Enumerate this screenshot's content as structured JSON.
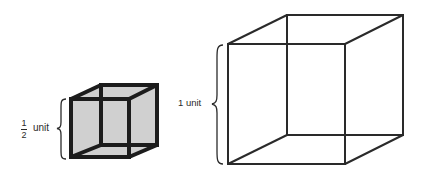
{
  "diagram": {
    "small_cube": {
      "label_fraction": {
        "numerator": "1",
        "denominator": "2"
      },
      "label_unit": "unit",
      "fill_color": "#d0d0d0",
      "stroke_color": "#1c1c1c",
      "front": {
        "x1": 71,
        "y1": 99,
        "x2": 129,
        "y2": 157
      },
      "back": {
        "x1": 101,
        "y1": 85,
        "x2": 157,
        "y2": 145
      }
    },
    "large_cube": {
      "label": "1 unit",
      "fill_color": "#ffffff",
      "stroke_color": "#2a2a2a",
      "front": {
        "x1": 228,
        "y1": 44,
        "x2": 345,
        "y2": 164
      },
      "back": {
        "x1": 287,
        "y1": 15,
        "x2": 403,
        "y2": 135
      }
    }
  }
}
